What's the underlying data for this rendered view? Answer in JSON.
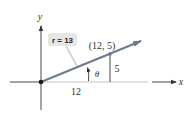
{
  "figure": {
    "type": "polar-coordinate-right-triangle",
    "axes": {
      "x_label": "x",
      "y_label": "y"
    },
    "point": {
      "label": "(12, 5)",
      "x": 12,
      "y": 5
    },
    "radius_label": "r = 13",
    "opposite_label": "5",
    "adjacent_label": "12",
    "angle_label": "θ",
    "colors": {
      "ray": "#6f7b87",
      "axis": "#333333",
      "x_axis_faded": "#b8bcc0",
      "label_box": "#e6e6e6",
      "text": "#333333"
    }
  }
}
